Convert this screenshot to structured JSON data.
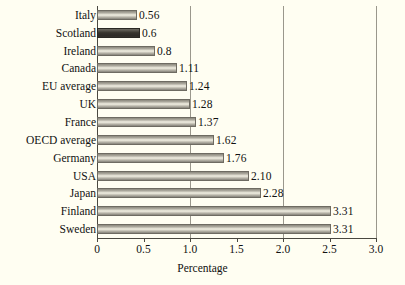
{
  "chart_data": {
    "type": "bar",
    "orientation": "horizontal",
    "title": "",
    "xlabel": "Percentage",
    "ylabel": "",
    "xlim": [
      0,
      3.0
    ],
    "xticks": [
      "0",
      "0.5",
      "1.0",
      "1.5",
      "2.0",
      "2.5",
      "3.0"
    ],
    "xtick_values": [
      0,
      0.5,
      1.0,
      1.5,
      2.0,
      2.5,
      3.0
    ],
    "gridlines": [
      1.0,
      2.0,
      3.0
    ],
    "grid": true,
    "legend": "none",
    "categories": [
      "Italy",
      "Scotland",
      "Ireland",
      "Canada",
      "EU average",
      "UK",
      "France",
      "OECD average",
      "Germany",
      "USA",
      "Japan",
      "Finland",
      "Sweden"
    ],
    "values": [
      0.56,
      0.6,
      0.8,
      1.11,
      1.24,
      1.28,
      1.37,
      1.62,
      1.76,
      2.1,
      2.28,
      3.31,
      3.31
    ],
    "labels": [
      "0.56",
      "0.6",
      "0.8",
      "1.11",
      "1.24",
      "1.28",
      "1.37",
      "1.62",
      "1.76",
      "2.10",
      "2.28",
      "3.31",
      "3.31"
    ],
    "bars": [
      {
        "category": "Italy",
        "value": 0.56,
        "label": "0.56",
        "bar_frac": 0.143,
        "highlight": false
      },
      {
        "category": "Scotland",
        "value": 0.6,
        "label": "0.6",
        "bar_frac": 0.154,
        "highlight": true
      },
      {
        "category": "Ireland",
        "value": 0.8,
        "label": "0.8",
        "bar_frac": 0.207,
        "highlight": false
      },
      {
        "category": "Canada",
        "value": 1.11,
        "label": "1.11",
        "bar_frac": 0.287,
        "highlight": false
      },
      {
        "category": "EU average",
        "value": 1.24,
        "label": "1.24",
        "bar_frac": 0.323,
        "highlight": false
      },
      {
        "category": "UK",
        "value": 1.28,
        "label": "1.28",
        "bar_frac": 0.333,
        "highlight": false
      },
      {
        "category": "France",
        "value": 1.37,
        "label": "1.37",
        "bar_frac": 0.355,
        "highlight": false
      },
      {
        "category": "OECD average",
        "value": 1.62,
        "label": "1.62",
        "bar_frac": 0.42,
        "highlight": false
      },
      {
        "category": "Germany",
        "value": 1.76,
        "label": "1.76",
        "bar_frac": 0.455,
        "highlight": false
      },
      {
        "category": "USA",
        "value": 2.1,
        "label": "2.10",
        "bar_frac": 0.545,
        "highlight": false
      },
      {
        "category": "Japan",
        "value": 2.28,
        "label": "2.28",
        "bar_frac": 0.588,
        "highlight": false
      },
      {
        "category": "Finland",
        "value": 3.31,
        "label": "3.31",
        "bar_frac": 0.838,
        "highlight": false
      },
      {
        "category": "Sweden",
        "value": 3.31,
        "label": "3.31",
        "bar_frac": 0.838,
        "highlight": false
      }
    ],
    "colors": {
      "background": "#fffef2",
      "bar": "#b5b2a6",
      "bar_highlight": "#33302b",
      "axis": "#4a4840",
      "grid": "#9a978c",
      "text": "#111111"
    }
  }
}
